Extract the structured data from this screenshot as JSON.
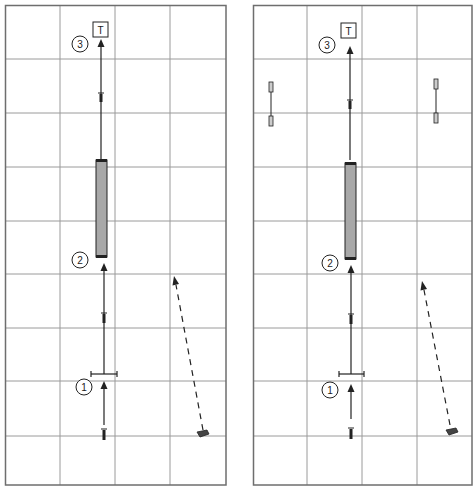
{
  "colors": {
    "grid": "#9a9a9a",
    "border": "#6e6e6e",
    "line": "#222222",
    "bar_fill": "#a8a8a8",
    "background": "#ffffff"
  },
  "panels": [
    {
      "id": "left",
      "labels": {
        "step1": "1",
        "step2": "2",
        "step3": "3",
        "target": "T"
      },
      "has_side_gates": false
    },
    {
      "id": "right",
      "labels": {
        "step1": "1",
        "step2": "2",
        "step3": "3",
        "target": "T"
      },
      "has_side_gates": true
    }
  ],
  "legend": {
    "step_markers": [
      "1",
      "2",
      "3"
    ],
    "target_marker": "T",
    "solid_arrow": "player run path",
    "dashed_arrow": "pass path",
    "shaded_bar": "long obstacle / bench",
    "hurdle": "hurdle bar",
    "side_gates": "cone gates"
  }
}
